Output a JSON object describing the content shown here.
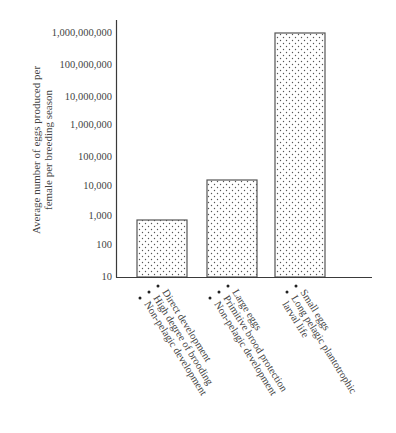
{
  "chart_data": {
    "type": "bar",
    "title": "",
    "xlabel": "",
    "ylabel": "Average number of eggs produced per female per breeding season",
    "ylabel_lines": [
      "Average number of eggs produced per",
      "female per breeding season"
    ],
    "yscale": "log",
    "ylim": [
      10,
      1000000000
    ],
    "yticks": [
      {
        "value": 10,
        "label": "10",
        "y": 276
      },
      {
        "value": 100,
        "label": "100",
        "y": 244
      },
      {
        "value": 1000,
        "label": "1,000",
        "y": 215
      },
      {
        "value": 10000,
        "label": "10,000",
        "y": 185
      },
      {
        "value": 100000,
        "label": "100,000",
        "y": 156
      },
      {
        "value": 1000000,
        "label": "1,000,000",
        "y": 124
      },
      {
        "value": 10000000,
        "label": "10,000,000",
        "y": 96
      },
      {
        "value": 100000000,
        "label": "100,000,000",
        "y": 64
      },
      {
        "value": 1000000000,
        "label": "1,000,000,000",
        "y": 32
      }
    ],
    "categories": [
      [
        "Direct development",
        "High degree of brooding",
        "Non-pelagic development"
      ],
      [
        "Large eggs",
        "Primitive brood protection",
        "Non-pelagic development"
      ],
      [
        "Small eggs",
        "Long pelagic plantotrophic",
        "larval life"
      ]
    ],
    "values": [
      700,
      15000,
      900000000
    ],
    "bar_tops_px": [
      220,
      180,
      33
    ],
    "bar_fill": "dotted stipple",
    "grid": false,
    "legend": null
  },
  "colors": {
    "axis": "#3a3a3a",
    "bar_border": "#555555",
    "dots": "#555555",
    "background": "#ffffff"
  }
}
